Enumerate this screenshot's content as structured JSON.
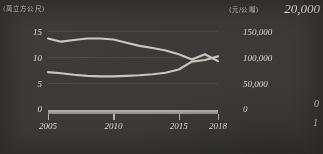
{
  "chart_data": {
    "type": "line",
    "title": "",
    "xlabel": "",
    "grid": true,
    "legend": "none",
    "x": [
      2005,
      2006,
      2007,
      2008,
      2009,
      2010,
      2011,
      2012,
      2013,
      2014,
      2015,
      2016,
      2017,
      2018
    ],
    "left_axis": {
      "unit_label": "(萬立方公尺)",
      "ticks": [
        "15",
        "10",
        "5",
        "0"
      ],
      "tick_values": [
        15,
        10,
        5,
        0
      ],
      "ylim": [
        0,
        17.5
      ]
    },
    "right_axis": {
      "unit_label": "(元/公噸)",
      "ticks": [
        "20,000",
        "150,000",
        "100,000",
        "50,000",
        "0"
      ],
      "tick_values": [
        200000,
        150000,
        100000,
        50000,
        0
      ],
      "ylim": [
        0,
        200000
      ]
    },
    "xticks": [
      "2005",
      "2010",
      "2015",
      "2018"
    ],
    "xtick_values": [
      2005,
      2010,
      2015,
      2018
    ],
    "series": [
      {
        "name": "upper-series",
        "axis": "left",
        "color": "#c9c6bd",
        "values": [
          13.6,
          13.0,
          13.3,
          13.6,
          13.6,
          13.4,
          12.8,
          12.2,
          11.8,
          11.3,
          10.6,
          9.6,
          10.6,
          9.3
        ]
      },
      {
        "name": "lower-series",
        "axis": "left",
        "color": "#c9c6bd",
        "values": [
          7.2,
          7.0,
          6.7,
          6.5,
          6.4,
          6.4,
          6.5,
          6.6,
          6.8,
          7.1,
          7.7,
          9.2,
          9.5,
          10.2
        ]
      }
    ]
  },
  "margin_bleed": {
    "zero": "0",
    "one": "1"
  }
}
